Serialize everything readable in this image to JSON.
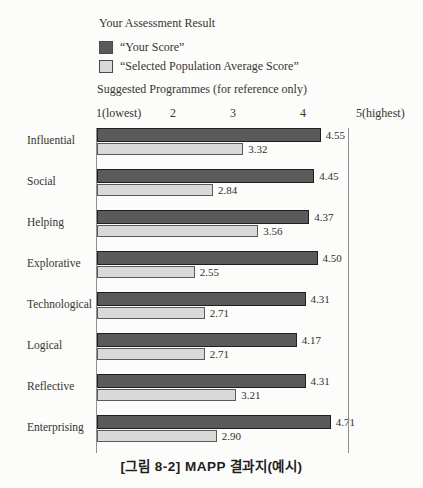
{
  "header": {
    "title": "Your Assessment Result",
    "legend": [
      {
        "name": "your-score",
        "label": "“Your Score”",
        "color": "#5a5a5a"
      },
      {
        "name": "selected-population-average",
        "label": "“Selected Population Average Score”",
        "color": "#d9d9d9"
      }
    ],
    "subtitle": "Suggested Programmes (for reference only)"
  },
  "chart_data": {
    "type": "bar",
    "orientation": "horizontal",
    "categories": [
      "Influential",
      "Social",
      "Helping",
      "Explorative",
      "Technological",
      "Logical",
      "Reflective",
      "Enterprising"
    ],
    "series": [
      {
        "name": "Your Score",
        "color": "#5a5a5a",
        "values": [
          4.55,
          4.45,
          4.37,
          4.5,
          4.31,
          4.17,
          4.31,
          4.71
        ]
      },
      {
        "name": "Selected Population Average Score",
        "color": "#d9d9d9",
        "values": [
          3.32,
          2.84,
          3.56,
          2.55,
          2.71,
          2.71,
          3.21,
          2.9
        ]
      }
    ],
    "xlim": [
      1,
      5
    ],
    "x_ticks": [
      "1(lowest)",
      "2",
      "3",
      "4",
      "5(highest)"
    ],
    "value_labels_shown": true,
    "legend_position": "top",
    "grid": false
  },
  "caption": "[그림 8-2] MAPP 결과지(예시)"
}
